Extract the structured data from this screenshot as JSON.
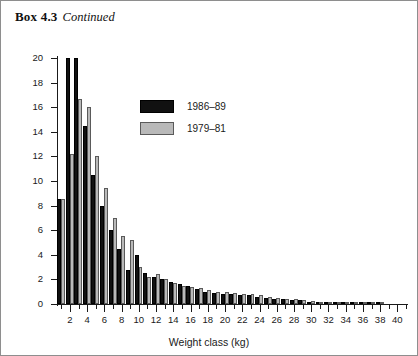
{
  "caption": {
    "box_label": "Box 4.3",
    "continued_label": "Continued"
  },
  "chart_data": {
    "type": "bar",
    "title": "",
    "xlabel": "Weight class (kg)",
    "ylabel": "Frequency",
    "xlim": [
      0.5,
      41
    ],
    "ylim": [
      0,
      20
    ],
    "ytick_labels": [
      "0",
      "2",
      "4",
      "6",
      "8",
      "10",
      "12",
      "14",
      "16",
      "18",
      "20"
    ],
    "ytick_values": [
      0,
      2,
      4,
      6,
      8,
      10,
      12,
      14,
      16,
      18,
      20
    ],
    "xtick_labels": [
      "2",
      "4",
      "6",
      "8",
      "10",
      "12",
      "14",
      "16",
      "18",
      "20",
      "22",
      "24",
      "26",
      "28",
      "30",
      "32",
      "34",
      "36",
      "38",
      "40"
    ],
    "xtick_values": [
      2,
      4,
      6,
      8,
      10,
      12,
      14,
      16,
      18,
      20,
      22,
      24,
      26,
      28,
      30,
      32,
      34,
      36,
      38,
      40
    ],
    "grid": false,
    "legend_position": "upper-center",
    "categories": [
      1,
      2,
      3,
      4,
      5,
      6,
      7,
      8,
      9,
      10,
      11,
      12,
      13,
      14,
      15,
      16,
      17,
      18,
      19,
      20,
      21,
      22,
      23,
      24,
      25,
      26,
      27,
      28,
      29,
      30,
      31,
      32,
      33,
      34,
      35,
      36,
      37,
      38,
      39,
      40
    ],
    "series": [
      {
        "name": "1986–89",
        "color": "#111111",
        "values": [
          8.5,
          20.0,
          20.0,
          14.5,
          10.5,
          8.0,
          6.0,
          4.5,
          2.8,
          4.0,
          2.5,
          2.2,
          2.0,
          1.8,
          1.6,
          1.5,
          1.2,
          1.0,
          0.9,
          0.8,
          0.8,
          0.7,
          0.7,
          0.6,
          0.5,
          0.4,
          0.4,
          0.3,
          0.3,
          0.2,
          0.15,
          0.1,
          0.1,
          0.1,
          0.05,
          0.05,
          0.05,
          0.05,
          0.0,
          0.0
        ]
      },
      {
        "name": "1979–81",
        "color": "#b9b9b9",
        "values": [
          8.5,
          12.2,
          16.7,
          16.0,
          12.0,
          9.4,
          7.0,
          5.5,
          5.2,
          3.0,
          2.2,
          2.4,
          2.0,
          1.7,
          1.5,
          1.4,
          1.3,
          1.1,
          1.0,
          1.0,
          0.9,
          0.8,
          0.8,
          0.7,
          0.6,
          0.5,
          0.4,
          0.4,
          0.3,
          0.25,
          0.15,
          0.1,
          0.1,
          0.1,
          0.05,
          0.05,
          0.05,
          0.05,
          0.0,
          0.0
        ]
      }
    ]
  }
}
